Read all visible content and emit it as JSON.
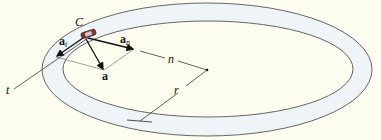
{
  "diagram": {
    "type": "curvilinear-motion-track",
    "colors": {
      "background": "#fdfdf0",
      "track_fill": "#eef4f8",
      "track_edge": "#666666",
      "car": "#8a2a2a",
      "arrow": "#111111"
    },
    "labels": {
      "car": "C",
      "tangential_accel": "a",
      "tangential_sub": "t",
      "normal_accel": "a",
      "normal_sub": "n",
      "total_accel": "a",
      "tangent_axis": "t",
      "normal_axis": "n",
      "radius": "r"
    }
  }
}
